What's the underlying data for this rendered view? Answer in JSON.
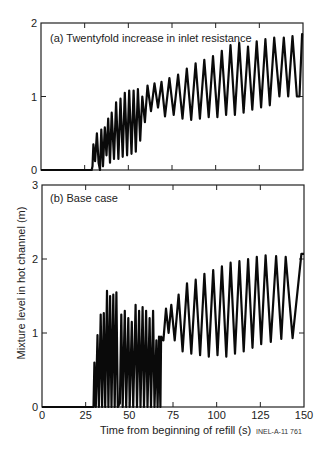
{
  "figure": {
    "ylabel": "Mixture level in hot channel (m)",
    "xlabel": "Time from beginning of refill (s)",
    "credit": "INEL-A-11 761"
  },
  "chart_data": [
    {
      "type": "line",
      "panel": "a",
      "title": "(a) Twentyfold increase in inlet resistance",
      "xlabel": "Time from beginning of refill (s)",
      "ylabel": "Mixture level in hot channel (m)",
      "xlim": [
        0,
        150
      ],
      "ylim": [
        0,
        2
      ],
      "xticks": [
        0,
        25,
        50,
        75,
        100,
        125,
        150
      ],
      "yticks": [
        0,
        1,
        2
      ],
      "ytick_labels": [
        "0",
        "1",
        "2"
      ],
      "grid": false,
      "series": [
        {
          "name": "mixture level",
          "points": [
            [
              0,
              0
            ],
            [
              29,
              0
            ],
            [
              29.5,
              0.05
            ],
            [
              30,
              0.35
            ],
            [
              31,
              0.12
            ],
            [
              32,
              0.5
            ],
            [
              33,
              0.1
            ],
            [
              33.8,
              0.0
            ],
            [
              34.5,
              0.55
            ],
            [
              35.5,
              0.05
            ],
            [
              36.5,
              0.58
            ],
            [
              37.5,
              0.2
            ],
            [
              38.5,
              0.7
            ],
            [
              39.5,
              0.1
            ],
            [
              40.5,
              0.78
            ],
            [
              41.8,
              0.15
            ],
            [
              43,
              0.92
            ],
            [
              44.3,
              0.15
            ],
            [
              45.5,
              0.97
            ],
            [
              46.8,
              0.18
            ],
            [
              48,
              1.05
            ],
            [
              49.3,
              0.2
            ],
            [
              50.5,
              1.08
            ],
            [
              51.8,
              0.22
            ],
            [
              53,
              1.08
            ],
            [
              54.3,
              0.25
            ],
            [
              55.5,
              1.1
            ],
            [
              56.8,
              0.4
            ],
            [
              58,
              1.0
            ],
            [
              59.5,
              0.65
            ],
            [
              61,
              1.15
            ],
            [
              63,
              0.8
            ],
            [
              65,
              1.18
            ],
            [
              67,
              0.85
            ],
            [
              69,
              1.2
            ],
            [
              71,
              0.73
            ],
            [
              73.5,
              1.25
            ],
            [
              76,
              0.75
            ],
            [
              78.5,
              1.3
            ],
            [
              81,
              0.7
            ],
            [
              83.5,
              1.38
            ],
            [
              86,
              0.68
            ],
            [
              88.5,
              1.45
            ],
            [
              91,
              0.7
            ],
            [
              93.5,
              1.5
            ],
            [
              96,
              0.72
            ],
            [
              98.5,
              1.55
            ],
            [
              101,
              0.72
            ],
            [
              103.5,
              1.62
            ],
            [
              106,
              0.75
            ],
            [
              108.5,
              1.7
            ],
            [
              111,
              0.75
            ],
            [
              113.5,
              1.73
            ],
            [
              116,
              0.78
            ],
            [
              118.5,
              1.68
            ],
            [
              121,
              0.82
            ],
            [
              123.5,
              1.75
            ],
            [
              126,
              0.85
            ],
            [
              128.5,
              1.78
            ],
            [
              131,
              0.88
            ],
            [
              133.5,
              1.8
            ],
            [
              136.5,
              1.0
            ],
            [
              139,
              1.8
            ],
            [
              141.5,
              1.0
            ],
            [
              144,
              1.82
            ],
            [
              146.5,
              1.0
            ],
            [
              148,
              1.0
            ],
            [
              149.5,
              1.85
            ],
            [
              150,
              1.85
            ]
          ]
        }
      ]
    },
    {
      "type": "line",
      "panel": "b",
      "title": "(b) Base case",
      "xlabel": "Time from beginning of refill (s)",
      "ylabel": "Mixture level in hot channel (m)",
      "xlim": [
        0,
        150
      ],
      "ylim": [
        0,
        3
      ],
      "xticks": [
        0,
        25,
        50,
        75,
        100,
        125,
        150
      ],
      "xtick_labels": [
        "0",
        "25",
        "50",
        "75",
        "100",
        "125",
        "150"
      ],
      "yticks": [
        0,
        1,
        2,
        3
      ],
      "ytick_labels": [
        "0",
        "1",
        "2",
        "3"
      ],
      "grid": false,
      "series": [
        {
          "name": "mixture level",
          "points": [
            [
              0,
              0
            ],
            [
              29.5,
              0
            ],
            [
              30,
              0.6
            ],
            [
              30.8,
              0
            ],
            [
              31.8,
              0.97
            ],
            [
              32.6,
              0
            ],
            [
              33.6,
              1.25
            ],
            [
              34.4,
              0
            ],
            [
              35.4,
              1.27
            ],
            [
              36.2,
              0
            ],
            [
              37.2,
              1.57
            ],
            [
              38,
              0
            ],
            [
              39,
              1.5
            ],
            [
              39.8,
              0
            ],
            [
              40.8,
              1.52
            ],
            [
              41.6,
              0
            ],
            [
              42.6,
              1.55
            ],
            [
              43.4,
              0
            ],
            [
              44.6,
              0.05
            ],
            [
              45.4,
              1.25
            ],
            [
              46.2,
              0
            ],
            [
              47.4,
              1.3
            ],
            [
              48.2,
              0
            ],
            [
              49.4,
              1.2
            ],
            [
              50.2,
              0
            ],
            [
              51.4,
              1.15
            ],
            [
              52.2,
              0
            ],
            [
              53.6,
              1.38
            ],
            [
              54.4,
              0
            ],
            [
              55.6,
              1.3
            ],
            [
              56.4,
              0
            ],
            [
              57.6,
              1.35
            ],
            [
              58.4,
              0
            ],
            [
              59.6,
              1.3
            ],
            [
              60.4,
              0
            ],
            [
              61.6,
              1.2
            ],
            [
              62.4,
              0
            ],
            [
              63.6,
              1.3
            ],
            [
              64.4,
              0
            ],
            [
              65.5,
              0.9
            ],
            [
              66.2,
              0
            ],
            [
              67,
              0.95
            ],
            [
              67.8,
              0.0
            ],
            [
              68.2,
              0.95
            ],
            [
              69.5,
              0.9
            ],
            [
              71,
              1.33
            ],
            [
              72.5,
              1.0
            ],
            [
              74,
              1.38
            ],
            [
              76,
              0.9
            ],
            [
              78.2,
              1.52
            ],
            [
              80.5,
              0.75
            ],
            [
              83,
              1.67
            ],
            [
              85.5,
              0.72
            ],
            [
              88,
              1.72
            ],
            [
              90.5,
              0.7
            ],
            [
              93,
              1.8
            ],
            [
              95.5,
              0.68
            ],
            [
              98,
              1.85
            ],
            [
              100.5,
              0.7
            ],
            [
              103,
              1.9
            ],
            [
              105.5,
              0.68
            ],
            [
              108,
              1.95
            ],
            [
              110.5,
              0.72
            ],
            [
              113,
              1.97
            ],
            [
              115.5,
              0.75
            ],
            [
              118,
              2.0
            ],
            [
              120.5,
              0.8
            ],
            [
              123,
              2.03
            ],
            [
              125.5,
              0.85
            ],
            [
              128,
              2.05
            ],
            [
              131,
              0.88
            ],
            [
              134,
              2.04
            ],
            [
              137,
              0.92
            ],
            [
              139.5,
              2.03
            ],
            [
              143.5,
              0.93
            ],
            [
              148.5,
              2.07
            ],
            [
              150,
              2.07
            ]
          ]
        }
      ]
    }
  ]
}
